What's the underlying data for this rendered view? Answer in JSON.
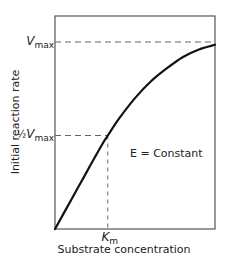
{
  "chart_data": {
    "type": "line",
    "title": "",
    "xlabel": "Substrate concentration",
    "ylabel": "Initial reaction rate",
    "annotation": "E = Constant",
    "legend": "none",
    "grid": false,
    "xlim": [
      0,
      1
    ],
    "ylim": [
      0,
      1.1
    ],
    "reference_lines": {
      "vmax": {
        "label_main": "V",
        "label_sub": "max",
        "y": 1.0
      },
      "half_vmax": {
        "label_prefix": "½",
        "label_main": "V",
        "label_sub": "max",
        "y": 0.5
      },
      "km": {
        "label_main": "K",
        "label_sub": "m",
        "x": 0.33
      }
    },
    "series": [
      {
        "name": "Michaelis-Menten curve",
        "x": [
          0,
          0.05,
          0.1,
          0.15,
          0.2,
          0.25,
          0.3,
          0.33,
          0.4,
          0.5,
          0.6,
          0.7,
          0.8,
          0.9,
          1.0
        ],
        "y": [
          0,
          0.077,
          0.154,
          0.231,
          0.308,
          0.385,
          0.46,
          0.5,
          0.59,
          0.7,
          0.79,
          0.86,
          0.92,
          0.96,
          0.985
        ]
      }
    ]
  }
}
